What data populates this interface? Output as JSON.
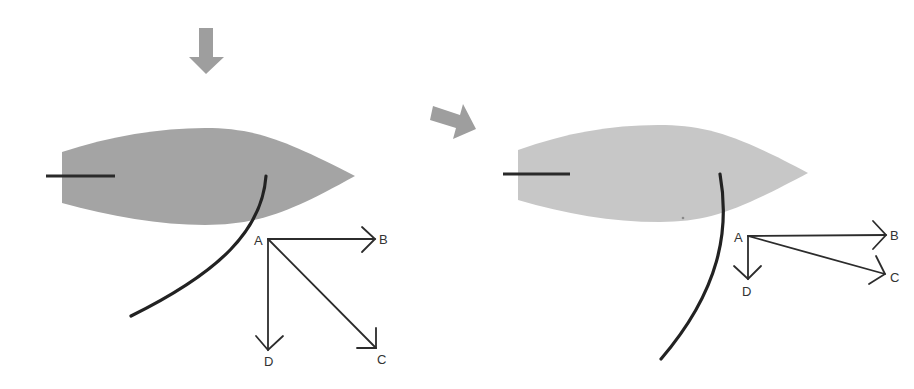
{
  "figure": {
    "type": "force-vector diagram of a sailing boat (before and after)",
    "colors": {
      "background": "#ffffff",
      "hull_before": "#a4a4a4",
      "hull_after": "#c7c7c7",
      "arrows": "#9e9e9e",
      "lines": "#2a2a2a"
    }
  },
  "panels": [
    {
      "id": "before",
      "indicator_arrow": {
        "direction": "down"
      },
      "boat": {
        "shade": "dark"
      },
      "vectors": {
        "origin": {
          "label": "A"
        },
        "targets": [
          {
            "label": "B",
            "direction": "right"
          },
          {
            "label": "C",
            "direction": "down-right (diagonal, 45°)"
          },
          {
            "label": "D",
            "direction": "down"
          }
        ]
      }
    },
    {
      "id": "after",
      "boat": {
        "shade": "light"
      },
      "vectors": {
        "origin": {
          "label": "A"
        },
        "targets": [
          {
            "label": "B",
            "direction": "right"
          },
          {
            "label": "C",
            "direction": "right, slightly down"
          },
          {
            "label": "D",
            "direction": "down (short)"
          }
        ]
      }
    }
  ],
  "transition_arrow": {
    "direction": "right, slightly down",
    "meaning": "leads from before to after"
  }
}
